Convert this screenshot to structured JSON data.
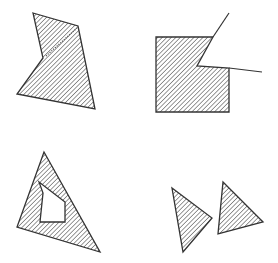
{
  "figure": {
    "hatch_color": "#444444",
    "outline_color": "#333333",
    "background_color": "#ffffff",
    "panels": [
      {
        "id": "concave-polygon",
        "label": "Concave polygon with dotted internal edge"
      },
      {
        "id": "square-with-notch",
        "label": "Square with wedge-shaped notch and extended lines"
      },
      {
        "id": "triangle-with-hole",
        "label": "Triangle containing a polygonal hole"
      },
      {
        "id": "two-triangles",
        "label": "Two separate hatched triangles"
      }
    ]
  }
}
